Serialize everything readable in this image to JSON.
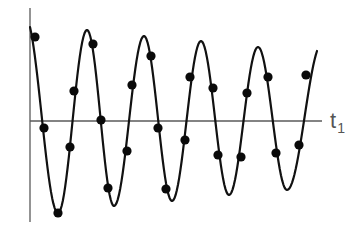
{
  "chart_data": {
    "type": "line",
    "title": "",
    "xlabel": "t",
    "xlabel_subscript": "1",
    "ylabel": "",
    "grid": false,
    "legend": null,
    "pixel_frame": {
      "y_axis_x": 30,
      "y_axis_top": 8,
      "y_axis_bottom": 222,
      "x_axis_y": 121,
      "x_axis_left": 30,
      "x_axis_right": 322
    },
    "curve": {
      "model": "damped_sine",
      "x_start": 30,
      "x_end": 317,
      "center_y": 121,
      "amplitude_start": 94,
      "amplitude_end": 70,
      "period": 57.5,
      "first_peak_x": 87,
      "extrema": [
        {
          "kind": "start",
          "x": 30,
          "y": 27
        },
        {
          "kind": "trough",
          "x": 58,
          "y": 213
        },
        {
          "kind": "peak",
          "x": 87,
          "y": 30
        },
        {
          "kind": "trough",
          "x": 114,
          "y": 206
        },
        {
          "kind": "peak",
          "x": 144,
          "y": 36
        },
        {
          "kind": "trough",
          "x": 172,
          "y": 201
        },
        {
          "kind": "peak",
          "x": 201,
          "y": 41
        },
        {
          "kind": "trough",
          "x": 229,
          "y": 195
        },
        {
          "kind": "peak",
          "x": 258,
          "y": 47
        },
        {
          "kind": "trough",
          "x": 287,
          "y": 190
        },
        {
          "kind": "end",
          "x": 317,
          "y": 51
        }
      ]
    },
    "sample_points": [
      {
        "x": 35,
        "y": 37
      },
      {
        "x": 44,
        "y": 128
      },
      {
        "x": 58,
        "y": 213
      },
      {
        "x": 70,
        "y": 147
      },
      {
        "x": 74,
        "y": 91
      },
      {
        "x": 93,
        "y": 44
      },
      {
        "x": 101,
        "y": 120
      },
      {
        "x": 108,
        "y": 188
      },
      {
        "x": 127,
        "y": 151
      },
      {
        "x": 132,
        "y": 85
      },
      {
        "x": 151,
        "y": 56
      },
      {
        "x": 158,
        "y": 128
      },
      {
        "x": 166,
        "y": 189
      },
      {
        "x": 185,
        "y": 140
      },
      {
        "x": 190,
        "y": 77
      },
      {
        "x": 213,
        "y": 88
      },
      {
        "x": 218,
        "y": 155
      },
      {
        "x": 241,
        "y": 157
      },
      {
        "x": 247,
        "y": 93
      },
      {
        "x": 268,
        "y": 77
      },
      {
        "x": 276,
        "y": 153
      },
      {
        "x": 299,
        "y": 145
      },
      {
        "x": 306,
        "y": 75
      }
    ],
    "colors": {
      "curve": "#111111",
      "points": "#0a0a0a",
      "axes": "#5a5a5a",
      "label": "#555555"
    }
  },
  "labels": {
    "x_axis": "t",
    "x_axis_sub": "1"
  }
}
